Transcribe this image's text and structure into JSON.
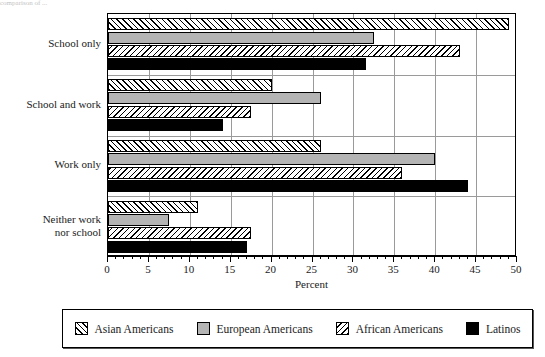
{
  "caption_remnant": "comparison of ...",
  "chart_data": {
    "type": "bar",
    "orientation": "horizontal",
    "title": "",
    "xlabel": "Percent",
    "ylabel": "",
    "xlim": [
      0,
      50
    ],
    "xticks": [
      0,
      5,
      10,
      15,
      20,
      25,
      30,
      35,
      40,
      45,
      50
    ],
    "xtick_labels": [
      "0",
      "5",
      "10",
      "15",
      "20",
      "25",
      "30",
      "35",
      "40",
      "45",
      "50"
    ],
    "minor_tick_step": 1,
    "grid": true,
    "legend_position": "bottom",
    "categories": [
      "School only",
      "School and work",
      "Work only",
      "Neither work nor school"
    ],
    "category_label_lines": [
      [
        "School only"
      ],
      [
        "School and work"
      ],
      [
        "Work only"
      ],
      [
        "Neither work",
        "nor school"
      ]
    ],
    "series": [
      {
        "name": "Asian Americans",
        "pattern": "forward-hatch",
        "color": "#ffffff",
        "values": [
          49.0,
          20.0,
          26.0,
          11.0
        ]
      },
      {
        "name": "European Americans",
        "pattern": "solid-gray",
        "color": "#b4b4b4",
        "values": [
          32.5,
          26.0,
          40.0,
          7.5
        ]
      },
      {
        "name": "African Americans",
        "pattern": "backward-hatch",
        "color": "#ffffff",
        "values": [
          43.0,
          17.5,
          36.0,
          17.5
        ]
      },
      {
        "name": "Latinos",
        "pattern": "solid-black",
        "color": "#000000",
        "values": [
          31.5,
          14.0,
          44.0,
          17.0
        ]
      }
    ]
  },
  "legend": {
    "items": [
      {
        "label": "Asian Americans",
        "swatch": "forward-hatch-swatch"
      },
      {
        "label": "European Americans",
        "swatch": "gray-swatch"
      },
      {
        "label": "African Americans",
        "swatch": "backward-hatch-swatch"
      },
      {
        "label": "Latinos",
        "swatch": "black-swatch"
      }
    ]
  }
}
